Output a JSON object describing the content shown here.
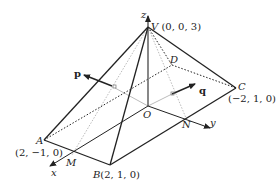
{
  "diagram": {
    "type": "3d-pyramid",
    "points": {
      "V": {
        "label": "V",
        "coords": "(0, 0, 3)"
      },
      "A": {
        "label": "A",
        "coords": "(2, −1, 0)"
      },
      "B": {
        "label": "B",
        "coords": "(2, 1, 0)"
      },
      "C": {
        "label": "C",
        "coords": "(−2, 1, 0)"
      },
      "D": {
        "label": "D"
      },
      "O": {
        "label": "O"
      },
      "M": {
        "label": "M"
      },
      "N": {
        "label": "N"
      }
    },
    "axes": {
      "x": "x",
      "y": "y",
      "z": "z"
    },
    "vectors": {
      "p": "p",
      "q": "q"
    }
  }
}
